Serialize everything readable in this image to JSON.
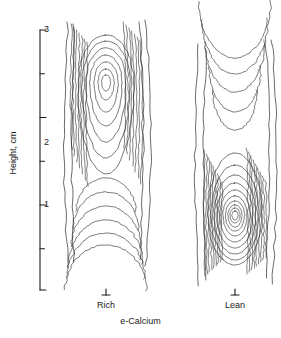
{
  "figure": {
    "y_axis_title": "Height, cm",
    "x_axis_title": "e-Calcium",
    "category_left": "Rich",
    "category_right": "Lean",
    "tick_label_3": "3",
    "tick_label_2": "2",
    "tick_label_1": "1",
    "line_color": "#2b2b2b",
    "axis_color": "#1a1a1a"
  },
  "chart_data": {
    "type": "line",
    "title": "",
    "xlabel": "e-Calcium",
    "ylabel": "Height, cm",
    "categories": [
      "Rich",
      "Lean"
    ],
    "ylim": [
      0,
      3.2
    ],
    "yticks_major": [
      1,
      2,
      3
    ],
    "yticks_minor": [
      0.5,
      1.5,
      2.5
    ],
    "grid": false,
    "legend": "none",
    "panels": [
      {
        "name": "Rich",
        "peak_height_cm": 2.45,
        "peak_x_px": 106,
        "peak_y_px": 82,
        "n_contours": 13,
        "outer_extent_cm": [
          0.45,
          3.25
        ],
        "shape": "Contours are tall and narrow, closed near the top with a small central oval at 2.45 cm; lower contours open downward in nested U shapes reaching about 0.5 cm."
      },
      {
        "name": "Lean",
        "peak_height_cm": 0.85,
        "peak_x_px": 235,
        "peak_y_px": 215,
        "n_contours": 13,
        "outer_extent_cm": [
          0.35,
          3.3
        ],
        "shape": "Contours form a dense concentric bullseye centred at 0.85 cm; outer contours are elongated upward forming nested inverted-U shapes reaching past 3 cm."
      }
    ],
    "series": [
      {
        "name": "Rich",
        "values": [
          0.45,
          3.25
        ],
        "note": "vertical extent, cm"
      },
      {
        "name": "Lean",
        "values": [
          0.35,
          3.3
        ],
        "note": "vertical extent, cm"
      }
    ]
  }
}
